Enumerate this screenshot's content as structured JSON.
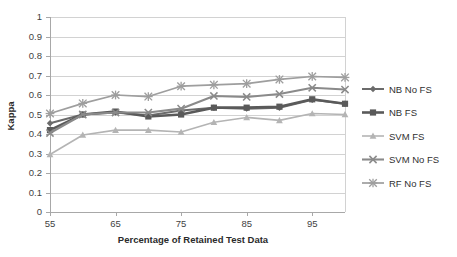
{
  "chart_data": {
    "type": "line",
    "title": "",
    "xlabel": "Percentage of Retained Test Data",
    "ylabel": "Kappa",
    "xlim": [
      55,
      100
    ],
    "ylim": [
      0,
      1
    ],
    "grid": true,
    "legend_position": "right",
    "x": [
      55,
      60,
      65,
      70,
      75,
      80,
      85,
      90,
      95,
      100
    ],
    "xticks": [
      "55",
      "65",
      "75",
      "85",
      "95"
    ],
    "xtick_values": [
      55,
      65,
      75,
      85,
      95
    ],
    "yticks": [
      "0",
      "0.1",
      "0.2",
      "0.3",
      "0.4",
      "0.5",
      "0.6",
      "0.7",
      "0.8",
      "0.9",
      "1"
    ],
    "ytick_values": [
      0,
      0.1,
      0.2,
      0.3,
      0.4,
      0.5,
      0.6,
      0.7,
      0.8,
      0.9,
      1
    ],
    "series": [
      {
        "name": "NB No FS",
        "marker": "diamond",
        "color": "#6b6b6b",
        "width": 2.0,
        "values": [
          0.455,
          0.5,
          0.51,
          0.495,
          0.52,
          0.535,
          0.53,
          0.535,
          0.575,
          0.555
        ]
      },
      {
        "name": "NB FS",
        "marker": "square",
        "color": "#5a5a5a",
        "width": 2.6,
        "values": [
          0.42,
          0.5,
          0.515,
          0.49,
          0.5,
          0.535,
          0.535,
          0.54,
          0.578,
          0.555
        ]
      },
      {
        "name": "SVM FS",
        "marker": "triangle",
        "color": "#b4b4b4",
        "width": 1.6,
        "values": [
          0.295,
          0.395,
          0.42,
          0.42,
          0.41,
          0.46,
          0.485,
          0.47,
          0.505,
          0.5
        ]
      },
      {
        "name": "SVM No FS",
        "marker": "x",
        "color": "#8a8a8a",
        "width": 2.1,
        "values": [
          0.405,
          0.5,
          0.51,
          0.51,
          0.53,
          0.595,
          0.59,
          0.605,
          0.637,
          0.628
        ]
      },
      {
        "name": "RF No FS",
        "marker": "star",
        "color": "#9e9e9e",
        "width": 1.7,
        "values": [
          0.505,
          0.557,
          0.6,
          0.592,
          0.645,
          0.652,
          0.658,
          0.68,
          0.695,
          0.69
        ]
      }
    ]
  },
  "legend": {
    "items": [
      {
        "label": "NB No FS"
      },
      {
        "label": "NB FS"
      },
      {
        "label": "SVM FS"
      },
      {
        "label": "SVM No FS"
      },
      {
        "label": "RF No FS"
      }
    ]
  },
  "colors": {
    "gridline": "#d2d2d2",
    "axis": "#a8a8a8",
    "text": "#3f3f3f",
    "background": "#ffffff"
  }
}
